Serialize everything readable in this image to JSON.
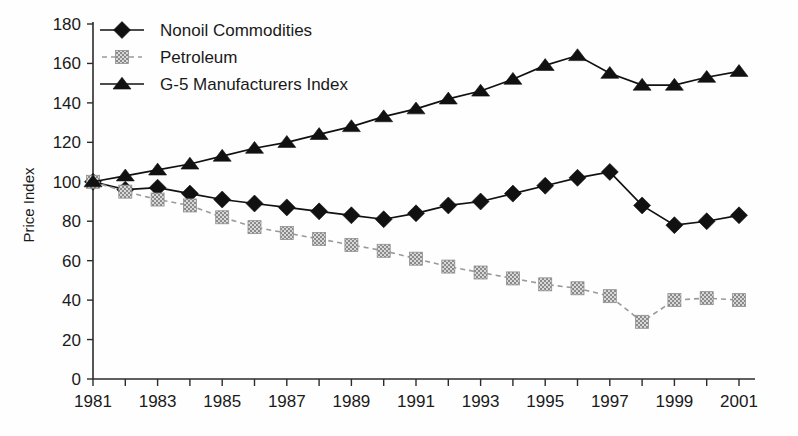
{
  "chart_data": {
    "type": "line",
    "title": "",
    "xlabel": "",
    "ylabel": "Price Index",
    "ylim": [
      0,
      180
    ],
    "xlim": [
      1981,
      2001
    ],
    "ytick_step": 20,
    "grid": false,
    "legend_position": "top-left",
    "x": [
      1981,
      1982,
      1983,
      1984,
      1985,
      1986,
      1987,
      1988,
      1989,
      1990,
      1991,
      1992,
      1993,
      1994,
      1995,
      1996,
      1997,
      1998,
      1999,
      2000,
      2001
    ],
    "xtick_labels": [
      "1981",
      "1983",
      "1985",
      "1987",
      "1989",
      "1991",
      "1993",
      "1995",
      "1997",
      "1999",
      "2001"
    ],
    "ytick_labels": [
      "0",
      "20",
      "40",
      "60",
      "80",
      "100",
      "120",
      "140",
      "160",
      "180"
    ],
    "series": [
      {
        "name": "Nonoil Commodities",
        "marker": "diamond",
        "line_style": "solid",
        "color": "#111111",
        "values": [
          100,
          96,
          97,
          94,
          91,
          89,
          87,
          85,
          83,
          81,
          84,
          88,
          90,
          94,
          98,
          102,
          105,
          88,
          78,
          80,
          83
        ]
      },
      {
        "name": "Petroleum",
        "marker": "square",
        "line_style": "dashed",
        "color": "#9a9a9a",
        "values": [
          100,
          95,
          91,
          88,
          82,
          77,
          74,
          71,
          68,
          65,
          61,
          57,
          54,
          51,
          48,
          46,
          42,
          29,
          40,
          41,
          40
        ]
      },
      {
        "name": "G-5 Manufacturers Index",
        "marker": "triangle",
        "line_style": "solid",
        "color": "#111111",
        "values": [
          100,
          103,
          106,
          109,
          113,
          117,
          120,
          124,
          128,
          133,
          137,
          142,
          146,
          152,
          159,
          164,
          155,
          149,
          149,
          153,
          156
        ]
      }
    ]
  },
  "legend": {
    "items": [
      {
        "label": "Nonoil Commodities"
      },
      {
        "label": "Petroleum"
      },
      {
        "label": "G-5 Manufacturers Index"
      }
    ]
  },
  "axes": {
    "y_title": "Price Index"
  }
}
